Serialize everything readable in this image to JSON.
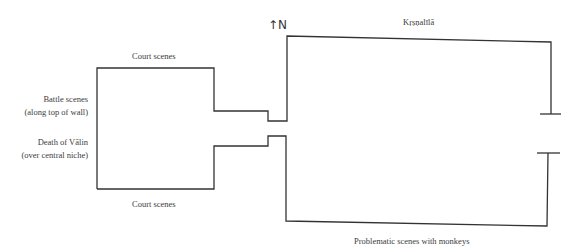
{
  "diagram": {
    "type": "architectural-floor-plan",
    "north_marker": "↑N",
    "line_color": "#333333",
    "labels": {
      "court_scenes_top": "Court scenes",
      "court_scenes_bottom": "Court scenes",
      "battle_scenes_line1": "Battle scenes",
      "battle_scenes_line2": "(along top of wall)",
      "death_of_valin_line1": "Death of Vālin",
      "death_of_valin_line2": "(over central niche)",
      "krisnalila": "Kṛṣṇalīlā",
      "problematic_scenes": "Problematic scenes with monkeys"
    }
  }
}
